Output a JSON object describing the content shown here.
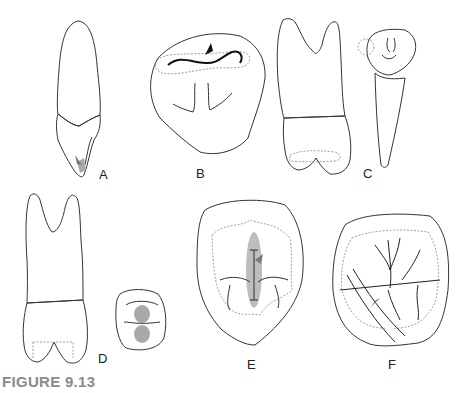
{
  "figure": {
    "caption": "FIGURE 9.13",
    "panels": [
      {
        "id": "A",
        "label": "A",
        "description": "Anterior tooth, lingual view with arrow at cingulum"
      },
      {
        "id": "B",
        "label": "B",
        "description": "Occlusal outline with shaded ridge and arrow"
      },
      {
        "id": "C",
        "label": "C",
        "description": "Premolar proximal and occlusal-oblique views"
      },
      {
        "id": "D",
        "label": "D",
        "description": "Two-rooted tooth with shaded root, occlusal view with two shaded pits"
      },
      {
        "id": "E",
        "label": "E",
        "description": "Occlusal view with shaded central groove and arrow"
      },
      {
        "id": "F",
        "label": "F",
        "description": "Molar occlusal view with shaded region, oblique band and arrow"
      }
    ]
  },
  "colors": {
    "outline": "#333333",
    "shade": "#bdbdbd",
    "root_shade": "#a9a9a9",
    "arrow": "#7a7a7a",
    "caption": "#8a8a8a"
  }
}
